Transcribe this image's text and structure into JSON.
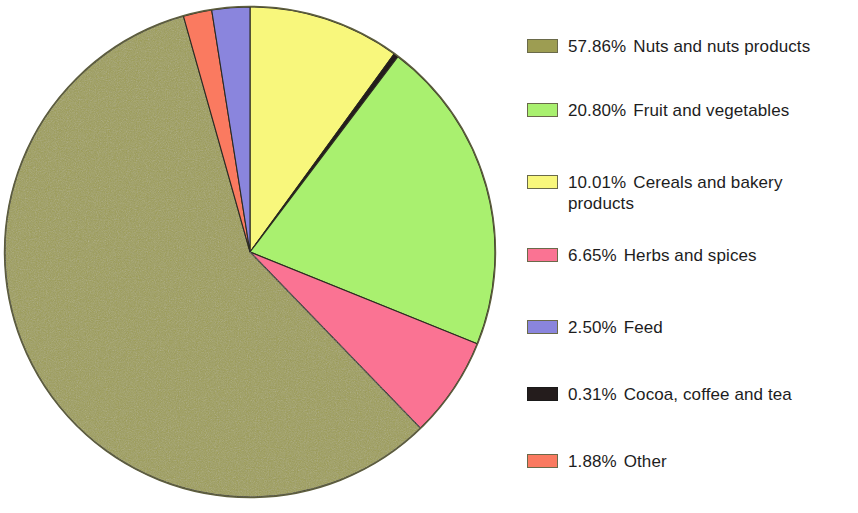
{
  "chart_data": {
    "type": "pie",
    "title": "",
    "subtitle": "",
    "xlabel": "",
    "ylabel": "",
    "legend_position": "right",
    "grid": false,
    "units": "%",
    "start_angle_deg": 0,
    "direction": "clockwise",
    "categories": [
      "Nuts and nuts products",
      "Fruit and vegetables",
      "Cereals and bakery products",
      "Herbs and spices",
      "Feed",
      "Cocoa, coffee and tea",
      "Other"
    ],
    "values": [
      57.86,
      20.8,
      10.01,
      6.65,
      2.5,
      0.31,
      1.88
    ],
    "colors": [
      "#9d9d52",
      "#a9f06f",
      "#f8f77c",
      "#fa7393",
      "#8a85dd",
      "#241c1c",
      "#fa7a60"
    ],
    "slices": [
      {
        "label": "Nuts and nuts products",
        "percent_label": "57.86%",
        "value": 57.86,
        "color": "#9d9d52"
      },
      {
        "label": "Fruit and vegetables",
        "percent_label": "20.80%",
        "value": 20.8,
        "color": "#a9f06f"
      },
      {
        "label": "Cereals and bakery products",
        "percent_label": "10.01%",
        "value": 10.01,
        "color": "#f8f77c"
      },
      {
        "label": "Herbs and spices",
        "percent_label": "6.65%",
        "value": 6.65,
        "color": "#fa7393"
      },
      {
        "label": "Feed",
        "percent_label": "2.50%",
        "value": 2.5,
        "color": "#8a85dd"
      },
      {
        "label": "Cocoa, coffee and tea",
        "percent_label": "0.31%",
        "value": 0.31,
        "color": "#241c1c"
      },
      {
        "label": "Other",
        "percent_label": "1.88%",
        "value": 1.88,
        "color": "#fa7a60"
      }
    ],
    "draw_order_clockwise_from_top": [
      "Cereals and bakery products",
      "Cocoa, coffee and tea",
      "Fruit and vegetables",
      "Herbs and spices",
      "Nuts and nuts products",
      "Other",
      "Feed"
    ]
  },
  "legend": {
    "items": [
      {
        "percent": "57.86%",
        "label": "Nuts and nuts products",
        "color": "#9d9d52",
        "top": 36,
        "two_line": false
      },
      {
        "percent": "20.80%",
        "label": "Fruit and vegetables",
        "color": "#a9f06f",
        "top": 100,
        "two_line": false
      },
      {
        "percent": "10.01%",
        "label": "Cereals and bakery\nproducts",
        "color": "#f8f77c",
        "top": 172,
        "two_line": true
      },
      {
        "percent": "6.65%",
        "label": "Herbs and spices",
        "color": "#fa7393",
        "top": 245,
        "two_line": false
      },
      {
        "percent": "2.50%",
        "label": "Feed",
        "color": "#8a85dd",
        "top": 317,
        "two_line": false
      },
      {
        "percent": "0.31%",
        "label": "Cocoa, coffee and tea",
        "color": "#241c1c",
        "top": 384,
        "two_line": false
      },
      {
        "percent": "1.88%",
        "label": "Other",
        "color": "#fa7a60",
        "top": 451,
        "two_line": false
      }
    ]
  }
}
